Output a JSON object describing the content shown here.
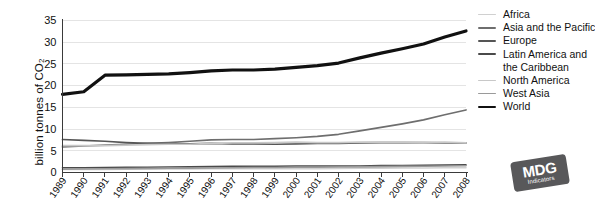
{
  "chart_data": {
    "type": "line",
    "title": "",
    "xlabel": "",
    "ylabel": "billion tonnes of CO",
    "ylabel_sub": "2",
    "ylim": [
      0,
      35
    ],
    "yticks": [
      0,
      5,
      10,
      15,
      20,
      25,
      30,
      35
    ],
    "ytick_labels": [
      "0",
      "5",
      "10",
      "15",
      "20",
      "25",
      "30",
      "35"
    ],
    "grid": true,
    "legend_position": "right",
    "x": [
      1989,
      1990,
      1991,
      1992,
      1993,
      1994,
      1995,
      1996,
      1997,
      1998,
      1999,
      2000,
      2001,
      2002,
      2003,
      2004,
      2005,
      2006,
      2007,
      2008
    ],
    "categories": [
      "1989",
      "1990",
      "1991",
      "1992",
      "1993",
      "1994",
      "1995",
      "1996",
      "1997",
      "1998",
      "1999",
      "2000",
      "2001",
      "2002",
      "2003",
      "2004",
      "2005",
      "2006",
      "2007",
      "2008"
    ],
    "series": [
      {
        "name": "Africa",
        "color": "#d0d0d0",
        "width": 1.6,
        "values": [
          0.7,
          0.7,
          0.7,
          0.75,
          0.75,
          0.8,
          0.8,
          0.85,
          0.85,
          0.85,
          0.9,
          0.9,
          0.9,
          0.95,
          1.0,
          1.0,
          1.05,
          1.05,
          1.1,
          1.1
        ]
      },
      {
        "name": "Asia and the Pacific",
        "color": "#6e6e6e",
        "width": 1.7,
        "values": [
          5.9,
          6.1,
          6.3,
          6.5,
          6.7,
          6.9,
          7.2,
          7.5,
          7.6,
          7.6,
          7.8,
          8.0,
          8.3,
          8.8,
          9.6,
          10.4,
          11.2,
          12.1,
          13.3,
          14.4
        ]
      },
      {
        "name": "Europe",
        "color": "#555555",
        "width": 1.7,
        "values": [
          7.6,
          7.4,
          7.2,
          6.9,
          6.7,
          6.6,
          6.6,
          6.7,
          6.6,
          6.6,
          6.5,
          6.6,
          6.7,
          6.7,
          6.8,
          6.9,
          6.9,
          6.9,
          6.8,
          6.8
        ]
      },
      {
        "name": "Latin America and the Caribbean",
        "color": "#4a4a4a",
        "width": 1.6,
        "values": [
          1.1,
          1.1,
          1.15,
          1.2,
          1.2,
          1.25,
          1.3,
          1.35,
          1.4,
          1.45,
          1.45,
          1.5,
          1.5,
          1.5,
          1.5,
          1.6,
          1.6,
          1.65,
          1.7,
          1.75
        ]
      },
      {
        "name": "North America",
        "color": "#c8c8c8",
        "width": 1.7,
        "values": [
          6.2,
          6.2,
          6.2,
          6.3,
          6.4,
          6.5,
          6.5,
          6.7,
          6.8,
          6.8,
          6.9,
          7.0,
          6.9,
          6.9,
          7.0,
          7.0,
          7.0,
          6.9,
          7.0,
          6.8
        ]
      },
      {
        "name": "West Asia",
        "color": "#9a9a9a",
        "width": 1.6,
        "values": [
          0.75,
          0.8,
          0.85,
          0.9,
          0.95,
          1.0,
          1.0,
          1.05,
          1.1,
          1.15,
          1.15,
          1.2,
          1.2,
          1.25,
          1.3,
          1.35,
          1.4,
          1.45,
          1.5,
          1.55
        ]
      },
      {
        "name": "World",
        "color": "#111111",
        "width": 3.2,
        "values": [
          18.0,
          18.6,
          22.4,
          22.5,
          22.6,
          22.7,
          23.0,
          23.4,
          23.6,
          23.6,
          23.8,
          24.2,
          24.6,
          25.2,
          26.4,
          27.5,
          28.5,
          29.6,
          31.2,
          32.6
        ]
      }
    ]
  },
  "legend": {
    "entries": [
      {
        "label": "Africa",
        "continuation": ""
      },
      {
        "label": "Asia and the Pacific",
        "continuation": ""
      },
      {
        "label": "Europe",
        "continuation": ""
      },
      {
        "label": "Latin America and",
        "continuation": "the Caribbean"
      },
      {
        "label": "North America",
        "continuation": ""
      },
      {
        "label": "West Asia",
        "continuation": ""
      },
      {
        "label": "World",
        "continuation": ""
      }
    ]
  },
  "logo": {
    "main": "MDG",
    "sub": "Indicators"
  }
}
